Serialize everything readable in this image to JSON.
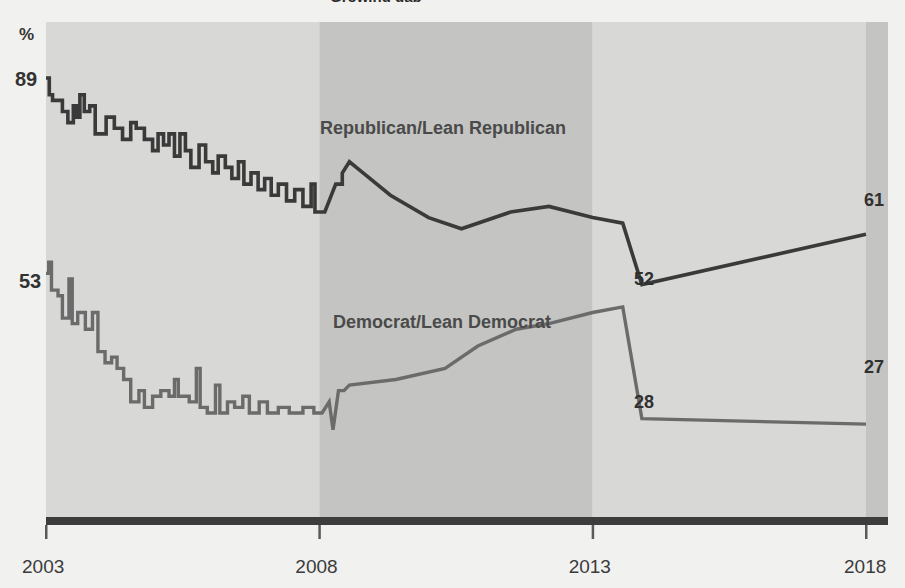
{
  "title_partial": "Growing gap",
  "chart_data": {
    "type": "line",
    "title": "",
    "xlabel": "",
    "ylabel": "%",
    "ylim": [
      20,
      95
    ],
    "xlim": [
      2003,
      2018
    ],
    "grid": false,
    "legend": "inline-labels",
    "x_ticks": [
      "2003",
      "2008",
      "2013",
      "2018"
    ],
    "y_ticks": [
      "89",
      "53"
    ],
    "y_axis_unit_label": "%",
    "shaded_bands": [
      {
        "from": 2003,
        "to": 2008,
        "shade": "light"
      },
      {
        "from": 2008,
        "to": 2013,
        "shade": "dark"
      },
      {
        "from": 2013,
        "to": 2018,
        "shade": "light"
      },
      {
        "from": 2018,
        "to": 2018.4,
        "shade": "dark"
      }
    ],
    "series": [
      {
        "name": "Republican/Lean Republican",
        "color": "#3a3a3a",
        "label_position": {
          "x": 320,
          "y": 134
        },
        "start_value": 89,
        "end_value": 61,
        "annotations": [
          {
            "text": "52",
            "value": 52,
            "x": 2013.9
          },
          {
            "text": "61",
            "value": 61,
            "x": 2018.0
          }
        ],
        "points": [
          [
            2003.0,
            89
          ],
          [
            2003.06,
            89
          ],
          [
            2003.06,
            86
          ],
          [
            2003.12,
            86
          ],
          [
            2003.12,
            85
          ],
          [
            2003.3,
            85
          ],
          [
            2003.3,
            83
          ],
          [
            2003.4,
            83
          ],
          [
            2003.4,
            81
          ],
          [
            2003.5,
            81
          ],
          [
            2003.5,
            84
          ],
          [
            2003.56,
            84
          ],
          [
            2003.56,
            82
          ],
          [
            2003.62,
            82
          ],
          [
            2003.62,
            86
          ],
          [
            2003.7,
            86
          ],
          [
            2003.7,
            83
          ],
          [
            2003.8,
            83
          ],
          [
            2003.8,
            84
          ],
          [
            2003.9,
            84
          ],
          [
            2003.9,
            79
          ],
          [
            2004.1,
            79
          ],
          [
            2004.1,
            82
          ],
          [
            2004.25,
            82
          ],
          [
            2004.25,
            80
          ],
          [
            2004.4,
            80
          ],
          [
            2004.4,
            78
          ],
          [
            2004.55,
            78
          ],
          [
            2004.55,
            81
          ],
          [
            2004.65,
            81
          ],
          [
            2004.65,
            80
          ],
          [
            2004.8,
            80
          ],
          [
            2004.8,
            78
          ],
          [
            2004.95,
            78
          ],
          [
            2004.95,
            76
          ],
          [
            2005.05,
            76
          ],
          [
            2005.05,
            79
          ],
          [
            2005.15,
            79
          ],
          [
            2005.15,
            77
          ],
          [
            2005.25,
            77
          ],
          [
            2005.25,
            79
          ],
          [
            2005.35,
            79
          ],
          [
            2005.35,
            75
          ],
          [
            2005.45,
            75
          ],
          [
            2005.45,
            79
          ],
          [
            2005.55,
            79
          ],
          [
            2005.55,
            76
          ],
          [
            2005.65,
            76
          ],
          [
            2005.65,
            73
          ],
          [
            2005.8,
            73
          ],
          [
            2005.8,
            77
          ],
          [
            2005.92,
            77
          ],
          [
            2005.92,
            74
          ],
          [
            2006.05,
            74
          ],
          [
            2006.05,
            72
          ],
          [
            2006.15,
            72
          ],
          [
            2006.15,
            75
          ],
          [
            2006.28,
            75
          ],
          [
            2006.28,
            73
          ],
          [
            2006.4,
            73
          ],
          [
            2006.4,
            71
          ],
          [
            2006.52,
            71
          ],
          [
            2006.52,
            74
          ],
          [
            2006.62,
            74
          ],
          [
            2006.62,
            70
          ],
          [
            2006.75,
            70
          ],
          [
            2006.75,
            72
          ],
          [
            2006.88,
            72
          ],
          [
            2006.88,
            69
          ],
          [
            2007.0,
            69
          ],
          [
            2007.0,
            71
          ],
          [
            2007.12,
            71
          ],
          [
            2007.12,
            68
          ],
          [
            2007.25,
            68
          ],
          [
            2007.25,
            70
          ],
          [
            2007.4,
            70
          ],
          [
            2007.4,
            67
          ],
          [
            2007.55,
            67
          ],
          [
            2007.55,
            69
          ],
          [
            2007.7,
            69
          ],
          [
            2007.7,
            66
          ],
          [
            2007.85,
            66
          ],
          [
            2007.85,
            70
          ],
          [
            2007.92,
            70
          ],
          [
            2007.92,
            65
          ],
          [
            2008.1,
            65
          ],
          [
            2008.3,
            70
          ],
          [
            2008.42,
            70
          ],
          [
            2008.42,
            72
          ],
          [
            2008.55,
            74
          ],
          [
            2008.8,
            72
          ],
          [
            2009.3,
            68
          ],
          [
            2010.0,
            64
          ],
          [
            2010.6,
            62
          ],
          [
            2011.5,
            65
          ],
          [
            2012.2,
            66
          ],
          [
            2013.0,
            64
          ],
          [
            2013.55,
            63
          ],
          [
            2013.9,
            52
          ],
          [
            2018.0,
            61
          ]
        ]
      },
      {
        "name": "Democrat/Lean Democrat",
        "color": "#6b6b6b",
        "label_position": {
          "x": 333,
          "y": 327
        },
        "start_value": 53,
        "end_value": 27,
        "annotations": [
          {
            "text": "28",
            "value": 28,
            "x": 2013.9
          },
          {
            "text": "27",
            "value": 27,
            "x": 2018.0
          }
        ],
        "points": [
          [
            2003.0,
            54
          ],
          [
            2003.05,
            54
          ],
          [
            2003.05,
            56
          ],
          [
            2003.1,
            56
          ],
          [
            2003.1,
            51
          ],
          [
            2003.22,
            51
          ],
          [
            2003.22,
            50
          ],
          [
            2003.3,
            50
          ],
          [
            2003.3,
            46
          ],
          [
            2003.42,
            46
          ],
          [
            2003.42,
            53
          ],
          [
            2003.48,
            53
          ],
          [
            2003.48,
            45
          ],
          [
            2003.58,
            45
          ],
          [
            2003.58,
            47
          ],
          [
            2003.72,
            47
          ],
          [
            2003.72,
            44
          ],
          [
            2003.85,
            44
          ],
          [
            2003.85,
            47
          ],
          [
            2003.95,
            47
          ],
          [
            2003.95,
            40
          ],
          [
            2004.08,
            40
          ],
          [
            2004.08,
            38
          ],
          [
            2004.2,
            38
          ],
          [
            2004.2,
            39
          ],
          [
            2004.3,
            39
          ],
          [
            2004.3,
            37
          ],
          [
            2004.42,
            37
          ],
          [
            2004.42,
            35
          ],
          [
            2004.55,
            35
          ],
          [
            2004.55,
            31
          ],
          [
            2004.7,
            31
          ],
          [
            2004.7,
            33
          ],
          [
            2004.8,
            33
          ],
          [
            2004.8,
            30
          ],
          [
            2004.95,
            30
          ],
          [
            2004.95,
            32
          ],
          [
            2005.1,
            32
          ],
          [
            2005.1,
            33
          ],
          [
            2005.25,
            33
          ],
          [
            2005.25,
            32
          ],
          [
            2005.35,
            32
          ],
          [
            2005.35,
            35
          ],
          [
            2005.42,
            35
          ],
          [
            2005.42,
            32
          ],
          [
            2005.62,
            32
          ],
          [
            2005.62,
            31
          ],
          [
            2005.75,
            31
          ],
          [
            2005.75,
            37
          ],
          [
            2005.82,
            37
          ],
          [
            2005.82,
            30
          ],
          [
            2005.95,
            30
          ],
          [
            2005.95,
            29
          ],
          [
            2006.1,
            29
          ],
          [
            2006.1,
            34
          ],
          [
            2006.18,
            34
          ],
          [
            2006.18,
            29
          ],
          [
            2006.32,
            29
          ],
          [
            2006.32,
            31
          ],
          [
            2006.45,
            31
          ],
          [
            2006.45,
            30
          ],
          [
            2006.6,
            30
          ],
          [
            2006.6,
            32
          ],
          [
            2006.72,
            32
          ],
          [
            2006.72,
            29
          ],
          [
            2006.9,
            29
          ],
          [
            2006.9,
            31
          ],
          [
            2007.05,
            31
          ],
          [
            2007.05,
            29
          ],
          [
            2007.25,
            29
          ],
          [
            2007.25,
            30
          ],
          [
            2007.45,
            30
          ],
          [
            2007.45,
            29
          ],
          [
            2007.7,
            29
          ],
          [
            2007.7,
            30
          ],
          [
            2007.9,
            30
          ],
          [
            2007.9,
            29
          ],
          [
            2008.05,
            29
          ],
          [
            2008.18,
            31
          ],
          [
            2008.25,
            26
          ],
          [
            2008.35,
            33
          ],
          [
            2008.45,
            33
          ],
          [
            2008.55,
            34
          ],
          [
            2009.4,
            35
          ],
          [
            2010.3,
            37
          ],
          [
            2010.9,
            41
          ],
          [
            2011.6,
            44
          ],
          [
            2012.2,
            45
          ],
          [
            2013.0,
            47
          ],
          [
            2013.55,
            48
          ],
          [
            2013.9,
            28
          ],
          [
            2018.0,
            27
          ]
        ]
      }
    ]
  },
  "colors": {
    "background": "#f1f1ef",
    "band_light": "#d8d8d6",
    "band_dark": "#c4c4c2",
    "axis": "#3d3d3d",
    "republican": "#3a3a3a",
    "democrat": "#6b6b6b",
    "tick_text": "#3b3b3b",
    "value_text": "#303030"
  }
}
